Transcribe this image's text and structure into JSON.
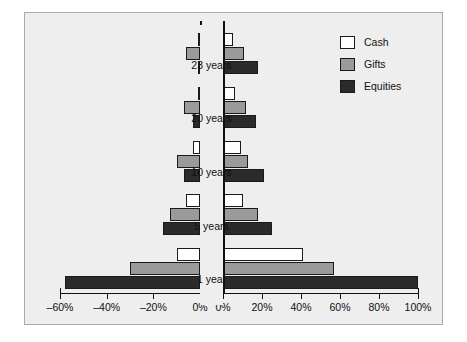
{
  "chart_data": {
    "type": "bar",
    "title": "",
    "subtitle": "",
    "xlabel": "",
    "ylabel": "",
    "orientation": "horizontal",
    "layout": "back-to-back diverging (tornado), two panels sharing category labels",
    "grid": false,
    "legend_position": "top-right",
    "categories": [
      "23 years",
      "20 years",
      "10 years",
      "5 years",
      "1 year"
    ],
    "left_panel": {
      "xlim": [
        -60,
        0
      ],
      "tick_values": [
        -60,
        -40,
        -20,
        0
      ],
      "tick_labels": [
        "–60%",
        "–40%",
        "–20%",
        "0%"
      ]
    },
    "right_panel": {
      "xlim": [
        0,
        100
      ],
      "tick_values": [
        0,
        20,
        40,
        60,
        80,
        100
      ],
      "tick_labels": [
        "0%",
        "20%",
        "40%",
        "60%",
        "80%",
        "100%"
      ]
    },
    "series": [
      {
        "name": "Cash",
        "color": "#ffffff",
        "left_values": [
          -1,
          -1,
          -3,
          -6,
          -10
        ],
        "right_values": [
          5,
          6,
          9,
          10,
          41
        ]
      },
      {
        "name": "Gifts",
        "color": "#9a9a9a",
        "left_values": [
          -6,
          -7,
          -10,
          -13,
          -30
        ],
        "right_values": [
          11,
          12,
          13,
          18,
          57
        ]
      },
      {
        "name": "Equities",
        "color": "#2b2b2b",
        "left_values": [
          -1,
          -3,
          -7,
          -16,
          -58
        ],
        "right_values": [
          18,
          17,
          21,
          25,
          100
        ]
      }
    ]
  },
  "legend": {
    "items": [
      {
        "label": "Cash"
      },
      {
        "label": "Gifts"
      },
      {
        "label": "Equities"
      }
    ]
  },
  "colors": {
    "background": "#eeeeee",
    "page": "#ffffff",
    "frame_border": "#aaaaaa",
    "axis": "#111111",
    "cash": "#ffffff",
    "gifts": "#9a9a9a",
    "equities": "#2b2b2b"
  }
}
